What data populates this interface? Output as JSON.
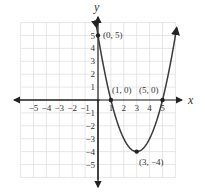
{
  "chart_data": {
    "type": "line",
    "title": "",
    "xlabel": "x",
    "ylabel": "y",
    "xlim": [
      -6,
      6
    ],
    "ylim": [
      -6,
      6
    ],
    "grid": true,
    "x_ticks": [
      "-5",
      "-4",
      "-3",
      "-2",
      "-1",
      "1",
      "2",
      "3",
      "4",
      "5"
    ],
    "y_ticks": [
      "5",
      "4",
      "3",
      "2",
      "1",
      "-1",
      "-2",
      "-3",
      "-4",
      "-5"
    ],
    "function": "y = x^2 - 6x + 5",
    "series": [
      {
        "name": "parabola",
        "x": [
          0,
          1,
          2,
          3,
          4,
          5,
          6
        ],
        "y": [
          5,
          0,
          -3,
          -4,
          -3,
          0,
          5
        ]
      }
    ],
    "points": [
      {
        "x": 0,
        "y": 5,
        "label": "(0, 5)"
      },
      {
        "x": 1,
        "y": 0,
        "label": "(1, 0)"
      },
      {
        "x": 5,
        "y": 0,
        "label": "(5, 0)"
      },
      {
        "x": 3,
        "y": -4,
        "label": "(3, −4)"
      }
    ],
    "colors": {
      "curve": "#3a3a3a",
      "grid": "#d9d9d9",
      "axis": "#222222"
    }
  },
  "labels": {
    "x_axis": "x",
    "y_axis": "y",
    "p0": "(0, 5)",
    "p1": "(1, 0)",
    "p2": "(5, 0)",
    "p3": "(3, −4)",
    "xt": [
      "−5",
      "−4",
      "−3",
      "−2",
      "−1",
      "1",
      "2",
      "3",
      "4",
      "5"
    ],
    "yt": [
      "5",
      "4",
      "3",
      "2",
      "1",
      "−1",
      "−2",
      "−3",
      "−4",
      "−5"
    ]
  }
}
